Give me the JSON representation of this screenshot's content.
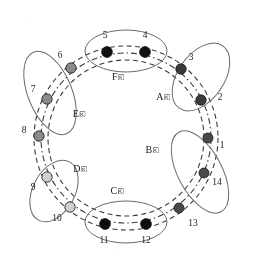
{
  "diagram": {
    "type": "ring-topology",
    "zones": [
      {
        "id": "A",
        "label": "A区",
        "nodes": [
          2,
          3
        ],
        "node_color": "#3a3a3a",
        "cx": 201,
        "cy": 77,
        "rx": 23,
        "ry": 38,
        "rot": 35,
        "label_x": 163,
        "label_y": 100
      },
      {
        "id": "B",
        "label": "B区",
        "nodes": [
          1,
          14,
          13
        ],
        "node_color": "#4a4a4a",
        "cx": 200,
        "cy": 172,
        "rx": 22,
        "ry": 45,
        "rot": -28,
        "label_x": 152,
        "label_y": 153
      },
      {
        "id": "C",
        "label": "C区",
        "nodes": [
          11,
          12
        ],
        "node_color": "#0d0d0d",
        "cx": 126,
        "cy": 222,
        "rx": 41,
        "ry": 21,
        "rot": 0,
        "label_x": 117,
        "label_y": 194
      },
      {
        "id": "D",
        "label": "D区",
        "nodes": [
          9,
          10
        ],
        "node_color": "#c9c9c9",
        "cx": 54,
        "cy": 191,
        "rx": 21,
        "ry": 33,
        "rot": 28,
        "label_x": 80,
        "label_y": 172
      },
      {
        "id": "E",
        "label": "E区",
        "nodes": [
          6,
          7,
          8
        ],
        "node_color": "#8a8a8a",
        "cx": 50,
        "cy": 93,
        "rx": 22,
        "ry": 44,
        "rot": -22,
        "label_x": 79,
        "label_y": 117
      },
      {
        "id": "F",
        "label": "F区",
        "nodes": [
          5,
          4
        ],
        "node_color": "#111111",
        "cx": 126,
        "cy": 51,
        "rx": 41,
        "ry": 21,
        "rot": 0,
        "label_x": 118,
        "label_y": 80
      }
    ],
    "nodes": [
      {
        "id": 1,
        "zone": "B",
        "x": 208,
        "y": 138,
        "label": "1",
        "label_x": 222,
        "label_y": 148,
        "color": "#4a4a4a",
        "r": 5.0
      },
      {
        "id": 2,
        "zone": "A",
        "x": 201,
        "y": 100,
        "label": "2",
        "label_x": 220,
        "label_y": 100,
        "color": "#3a3a3a",
        "r": 5.2
      },
      {
        "id": 3,
        "zone": "A",
        "x": 181,
        "y": 69,
        "label": "3",
        "label_x": 191,
        "label_y": 60,
        "color": "#3a3a3a",
        "r": 5.2
      },
      {
        "id": 4,
        "zone": "F",
        "x": 145,
        "y": 52,
        "label": "4",
        "label_x": 145,
        "label_y": 38,
        "color": "#111111",
        "r": 5.4
      },
      {
        "id": 5,
        "zone": "F",
        "x": 107,
        "y": 52,
        "label": "5",
        "label_x": 105,
        "label_y": 38,
        "color": "#111111",
        "r": 5.4
      },
      {
        "id": 6,
        "zone": "E",
        "x": 71,
        "y": 68,
        "label": "6",
        "label_x": 60,
        "label_y": 58,
        "color": "#8a8a8a",
        "r": 5.2
      },
      {
        "id": 7,
        "zone": "E",
        "x": 47,
        "y": 99,
        "label": "7",
        "label_x": 33,
        "label_y": 92,
        "color": "#8a8a8a",
        "r": 5.2
      },
      {
        "id": 8,
        "zone": "E",
        "x": 39,
        "y": 136,
        "label": "8",
        "label_x": 24,
        "label_y": 133,
        "color": "#8a8a8a",
        "r": 5.2
      },
      {
        "id": 9,
        "zone": "D",
        "x": 47,
        "y": 177,
        "label": "9",
        "label_x": 33,
        "label_y": 190,
        "color": "#cfcfcf",
        "r": 5.2
      },
      {
        "id": 10,
        "zone": "D",
        "x": 70,
        "y": 207,
        "label": "10",
        "label_x": 57,
        "label_y": 221,
        "color": "#cfcfcf",
        "r": 5.2
      },
      {
        "id": 11,
        "zone": "C",
        "x": 105,
        "y": 224,
        "label": "11",
        "label_x": 104,
        "label_y": 243,
        "color": "#0d0d0d",
        "r": 5.4
      },
      {
        "id": 12,
        "zone": "C",
        "x": 146,
        "y": 224,
        "label": "12",
        "label_x": 146,
        "label_y": 243,
        "color": "#0d0d0d",
        "r": 5.4
      },
      {
        "id": 13,
        "zone": "B",
        "x": 179,
        "y": 208,
        "label": "13",
        "label_x": 193,
        "label_y": 226,
        "color": "#4a4a4a",
        "r": 5.0
      },
      {
        "id": 14,
        "zone": "B",
        "x": 204,
        "y": 173,
        "label": "14",
        "label_x": 217,
        "label_y": 185,
        "color": "#4a4a4a",
        "r": 5.0
      }
    ],
    "rings": [
      {
        "name": "outer-ring",
        "radius_x": 92,
        "radius_y": 92,
        "style": "dashed"
      },
      {
        "name": "middle-ring",
        "radius_x": 85,
        "radius_y": 85,
        "style": "dash-dot"
      },
      {
        "name": "inner-ring",
        "radius_x": 78,
        "radius_y": 78,
        "style": "dashed"
      }
    ],
    "center": {
      "x": 126,
      "y": 138
    },
    "colors": {
      "stroke": "#3b3b3b",
      "zone_outline": "#6b6b6b",
      "background": "#ffffff",
      "text": "#1c1c1c"
    },
    "legend_note": ""
  }
}
